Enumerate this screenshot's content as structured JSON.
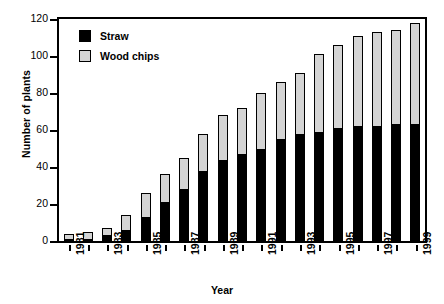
{
  "chart_data": {
    "type": "bar",
    "subtype": "stacked-bar",
    "title": "",
    "xlabel": "Year",
    "ylabel": "Number of plants",
    "ylim": [
      0,
      120
    ],
    "yticks": [
      0,
      20,
      40,
      60,
      80,
      100,
      120
    ],
    "ytick_labels": [
      "0",
      "20",
      "40",
      "60",
      "80",
      "100",
      "120"
    ],
    "grid": false,
    "legend_position": "upper-left-inside",
    "categories": [
      "1981",
      "1982",
      "1983",
      "1984",
      "1985",
      "1986",
      "1987",
      "1988",
      "1989",
      "1990",
      "1991",
      "1992",
      "1993",
      "1994",
      "1995",
      "1996",
      "1997",
      "1998",
      "1999"
    ],
    "xtick_labels_shown": [
      "1981",
      "1983",
      "1985",
      "1987",
      "1989",
      "1991",
      "1993",
      "1995",
      "1997",
      "1999"
    ],
    "series": [
      {
        "name": "Straw",
        "color": "#000000",
        "values": [
          1,
          1,
          3,
          6,
          13,
          21,
          28,
          38,
          44,
          47,
          50,
          55,
          58,
          59,
          61,
          62,
          62,
          63,
          63
        ]
      },
      {
        "name": "Wood chips",
        "color": "#d4d4d4",
        "values": [
          3,
          4,
          4,
          8,
          13,
          15,
          17,
          20,
          24,
          25,
          30,
          31,
          33,
          42,
          45,
          49,
          51,
          51,
          55
        ]
      }
    ],
    "totals": [
      4,
      5,
      7,
      14,
      26,
      36,
      45,
      58,
      68,
      72,
      80,
      86,
      91,
      101,
      106,
      111,
      113,
      114,
      118
    ]
  },
  "legend": {
    "items": [
      {
        "label": "Straw",
        "swatch": "straw"
      },
      {
        "label": "Wood chips",
        "swatch": "wood"
      }
    ]
  },
  "axes": {
    "y_title": "Number of plants",
    "x_title": "Year"
  }
}
